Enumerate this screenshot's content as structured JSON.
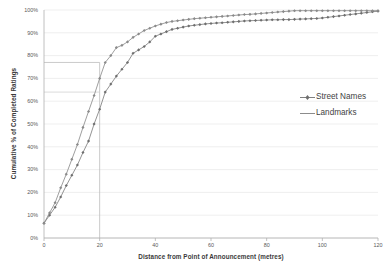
{
  "chart_data": {
    "type": "line",
    "title": "",
    "subtitle": "",
    "xlabel": "Distance from Point of Announcement (metres)",
    "ylabel": "Cumulative % of Completed Ratings",
    "xlim": [
      0,
      120
    ],
    "ylim": [
      0,
      100
    ],
    "grid": true,
    "legend_position": "right",
    "x_ticks": [
      0,
      20,
      40,
      60,
      80,
      100,
      120
    ],
    "x_tick_labels": [
      "0",
      "20",
      "40",
      "60",
      "80",
      "100",
      "120"
    ],
    "y_ticks": [
      0,
      10,
      20,
      30,
      40,
      50,
      60,
      70,
      80,
      90,
      100
    ],
    "y_tick_labels": [
      "0%",
      "10%",
      "20%",
      "30%",
      "40%",
      "50%",
      "60%",
      "70%",
      "80%",
      "90%",
      "100%"
    ],
    "annotations": {
      "reference_vertical_x": 20,
      "reference_horizontal_landmarks_y": 77,
      "reference_horizontal_street_names_y": 64
    },
    "series": [
      {
        "name": "Street Names",
        "marker": "diamond",
        "color": "#808080",
        "x": [
          0,
          2,
          4,
          6,
          8,
          10,
          12,
          14,
          16,
          18,
          20,
          22,
          24,
          26,
          28,
          30,
          32,
          34,
          36,
          38,
          40,
          42,
          44,
          46,
          48,
          50,
          52,
          54,
          56,
          58,
          60,
          62,
          64,
          66,
          68,
          70,
          72,
          74,
          76,
          78,
          80,
          82,
          84,
          86,
          88,
          90,
          92,
          94,
          96,
          98,
          100,
          102,
          104,
          106,
          108,
          110,
          112,
          114,
          116,
          118,
          120
        ],
        "values": [
          6.5,
          10,
          13.5,
          18,
          23,
          27.5,
          32,
          37.5,
          42.5,
          50,
          56.5,
          64,
          67.5,
          71,
          74,
          77,
          81,
          82.5,
          84,
          86,
          88.5,
          89.5,
          90.5,
          91.5,
          92,
          92.5,
          93,
          93.3,
          93.6,
          93.9,
          94.1,
          94.3,
          94.4,
          94.6,
          94.8,
          95,
          95.2,
          95.3,
          95.4,
          95.5,
          95.6,
          95.7,
          95.7,
          95.8,
          95.8,
          95.9,
          96,
          96.1,
          96.2,
          96.3,
          96.5,
          96.8,
          97.1,
          97.4,
          97.7,
          98,
          98.3,
          98.6,
          98.9,
          99.2,
          99.5
        ]
      },
      {
        "name": "Landmarks",
        "marker": "diamond",
        "color": "#8c8c8c",
        "x": [
          0,
          2,
          4,
          6,
          8,
          10,
          12,
          14,
          16,
          18,
          20,
          22,
          24,
          26,
          28,
          30,
          32,
          34,
          36,
          38,
          40,
          42,
          44,
          46,
          48,
          50,
          52,
          54,
          56,
          58,
          60,
          62,
          64,
          66,
          68,
          70,
          72,
          74,
          76,
          78,
          80,
          82,
          84,
          86,
          88,
          90,
          92,
          94,
          96,
          98,
          100,
          102,
          104,
          106,
          108,
          110,
          112,
          114,
          116,
          118,
          120
        ],
        "values": [
          6.5,
          11,
          15.5,
          22,
          28,
          34.5,
          41,
          48.5,
          55.5,
          62.5,
          70,
          77,
          80,
          83.5,
          84.5,
          86,
          88,
          89.5,
          91,
          92,
          93,
          93.8,
          94.5,
          95,
          95.3,
          95.6,
          95.9,
          96.2,
          96.4,
          96.6,
          96.8,
          97,
          97.2,
          97.4,
          97.6,
          97.8,
          98,
          98.1,
          98.3,
          98.5,
          98.7,
          98.9,
          99.1,
          99.3,
          99.5,
          99.7,
          99.7,
          99.7,
          99.7,
          99.7,
          99.7,
          99.7,
          99.7,
          99.7,
          99.7,
          99.7,
          99.7,
          99.7,
          99.7,
          99.7,
          99.7
        ]
      }
    ]
  },
  "legend": {
    "items": [
      {
        "label": "Street Names",
        "style": "line-marker"
      },
      {
        "label": "Landmarks",
        "style": "line"
      }
    ]
  },
  "colors": {
    "grid": "#e8e8e8",
    "axis": "#b0b0b0",
    "series_street_names": "#808080",
    "series_landmarks": "#8c8c8c",
    "text": "#3f3f3f",
    "background": "#ffffff"
  }
}
